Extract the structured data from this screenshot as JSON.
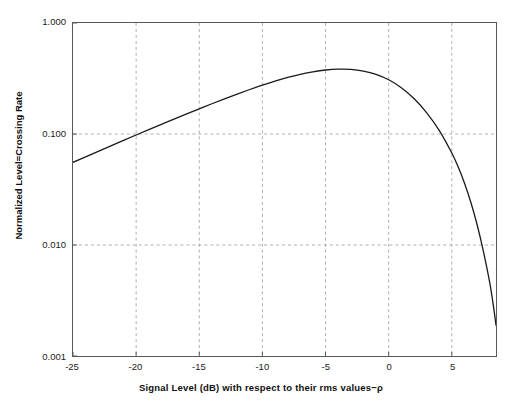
{
  "chart_data": {
    "type": "line",
    "title": "",
    "xlabel": "Signal Level (dB) with respect to their rms values−ρ",
    "ylabel": "Normalized Level=Crossing Rate",
    "xlim": [
      -25,
      8.5
    ],
    "ylim": [
      0.001,
      1.0
    ],
    "yscale": "log",
    "grid": true,
    "legend": null,
    "xticks": [
      -25,
      -20,
      -15,
      -10,
      -5,
      0,
      5
    ],
    "xtick_labels": [
      "-25",
      "-20",
      "-15",
      "-10",
      "-5",
      "0",
      "5"
    ],
    "yticks": [
      1.0,
      0.1,
      0.01,
      0.001
    ],
    "ytick_labels": [
      "1.000",
      "0.100",
      "0.010",
      "0.001"
    ],
    "series": [
      {
        "name": "Normalized level-crossing rate",
        "color": "#1a1a1a",
        "x": [
          -25,
          -24,
          -23,
          -22,
          -21,
          -20,
          -19,
          -18,
          -17,
          -16,
          -15,
          -14,
          -13,
          -12,
          -11,
          -10,
          -9,
          -8,
          -7,
          -6,
          -5,
          -4,
          -3,
          -2,
          -1,
          0,
          1,
          2,
          3,
          4,
          5,
          5.5,
          6,
          6.5,
          7,
          7.5,
          8,
          8.3,
          8.5
        ],
        "y": [
          0.0556,
          0.0623,
          0.0698,
          0.0782,
          0.0875,
          0.0979,
          0.1094,
          0.1221,
          0.1362,
          0.1517,
          0.1687,
          0.1873,
          0.2074,
          0.2289,
          0.2517,
          0.2754,
          0.2994,
          0.3229,
          0.3447,
          0.3634,
          0.3772,
          0.3841,
          0.3821,
          0.3693,
          0.3445,
          0.3079,
          0.2614,
          0.209,
          0.1561,
          0.1079,
          0.0674,
          0.0506,
          0.0362,
          0.0244,
          0.0153,
          0.0088,
          0.0046,
          0.0028,
          0.0019
        ]
      }
    ]
  },
  "axes": {
    "y_title": "Normalized Level=Crossing Rate",
    "x_title": "Signal Level (dB) with respect to their rms values−ρ"
  }
}
